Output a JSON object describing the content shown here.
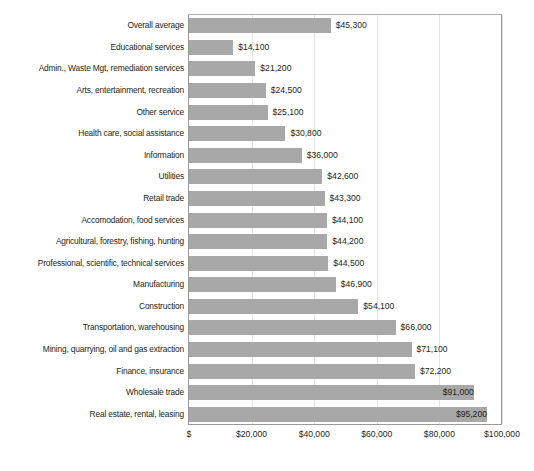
{
  "chart_data": {
    "type": "bar",
    "orientation": "horizontal",
    "title": "",
    "subtitle": "",
    "xlabel": "",
    "ylabel": "",
    "xlim": [
      0,
      100000
    ],
    "grid": true,
    "legend": null,
    "categories": [
      "Overall average",
      "Educational services",
      "Admin., Waste Mgt, remediation services",
      "Arts, entertainment, recreation",
      "Other service",
      "Health care, social assistance",
      "Information",
      "Utilities",
      "Retail trade",
      "Accomodation, food services",
      "Agricultural, forestry, fishing, hunting",
      "Professional, scientific, technical services",
      "Manufacturing",
      "Construction",
      "Transportation, warehousing",
      "Mining, quarrying, oil and gas extraction",
      "Finance, insurance",
      "Wholesale trade",
      "Real estate, rental, leasing"
    ],
    "values": [
      45300,
      14100,
      21200,
      24500,
      25100,
      30800,
      36000,
      42600,
      43300,
      44100,
      44200,
      44500,
      46900,
      54100,
      66000,
      71100,
      72200,
      91000,
      95200
    ],
    "data_labels": [
      "$45,300",
      "$14,100",
      "$21,200",
      "$24,500",
      "$25,100",
      "$30,800",
      "$36,000",
      "$42,600",
      "$43,300",
      "$44,100",
      "$44,200",
      "$44,500",
      "$46,900",
      "$54,100",
      "$66,000",
      "$71,100",
      "$72,200",
      "$91,000",
      "$95,200"
    ],
    "label_placement": [
      "outside",
      "outside",
      "outside",
      "outside",
      "outside",
      "outside",
      "outside",
      "outside",
      "outside",
      "outside",
      "outside",
      "outside",
      "outside",
      "outside",
      "outside",
      "outside",
      "outside",
      "inside",
      "inside"
    ],
    "xticks": [
      0,
      20000,
      40000,
      60000,
      80000,
      100000
    ],
    "xtick_labels": [
      "$",
      "$20,000",
      "$40,000",
      "$60,000",
      "$80,000",
      "$100,000"
    ],
    "bar_color": "#a8a8a8",
    "gridline_color": "#e3e3e3",
    "axis_color": "#9a9a9a",
    "text_color": "#231f20"
  }
}
